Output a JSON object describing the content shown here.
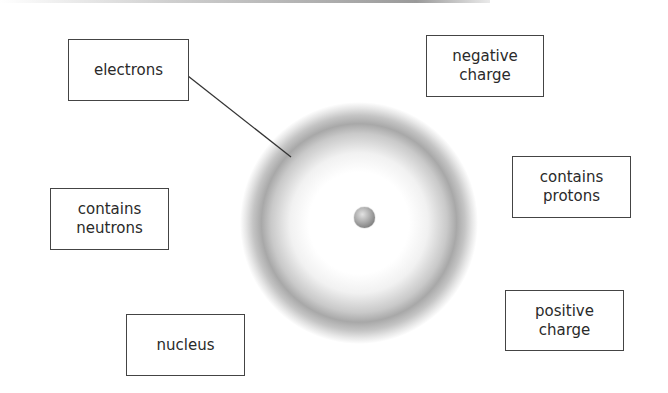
{
  "diagram": {
    "type": "atom-labeling",
    "labels": [
      {
        "id": "electrons",
        "text": "electrons"
      },
      {
        "id": "negative-charge",
        "text": "negative\ncharge"
      },
      {
        "id": "contains-protons",
        "text": "contains\nprotons"
      },
      {
        "id": "contains-neutrons",
        "text": "contains\nneutrons"
      },
      {
        "id": "positive-charge",
        "text": "positive\ncharge"
      },
      {
        "id": "nucleus",
        "text": "nucleus"
      }
    ],
    "leader_line": {
      "from_label": "electrons",
      "to": "electron-cloud"
    },
    "colors": {
      "box_border": "#444444",
      "text": "#2a2a2a",
      "cloud_ring": "#a8a8a8",
      "nucleus": "#8a8a8a"
    }
  }
}
